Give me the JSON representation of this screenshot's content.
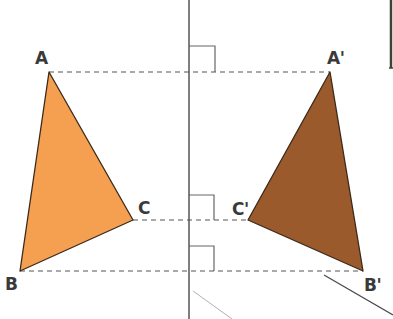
{
  "diagram": {
    "type": "reflection",
    "mirror_line": {
      "x": 189,
      "y1": 0,
      "y2": 319,
      "color": "#555555"
    },
    "colors": {
      "original_fill": "#f5a050",
      "image_fill": "#9b5a2c",
      "outline": "#3a2a1a",
      "dashed": "#555555",
      "right_angle": "#666666",
      "label": "#3a3a3a"
    },
    "original_triangle": {
      "vertices": [
        {
          "label": "A",
          "x": 49,
          "y": 72
        },
        {
          "label": "B",
          "x": 20,
          "y": 271
        },
        {
          "label": "C",
          "x": 133,
          "y": 220
        }
      ]
    },
    "image_triangle": {
      "vertices": [
        {
          "label": "A'",
          "x": 330,
          "y": 72
        },
        {
          "label": "B'",
          "x": 363,
          "y": 271
        },
        {
          "label": "C'",
          "x": 248,
          "y": 220
        }
      ]
    },
    "connector_lines": [
      {
        "from": "A",
        "to": "A'",
        "y": 72
      },
      {
        "from": "C",
        "to": "C'",
        "y": 220
      },
      {
        "from": "B",
        "to": "B'",
        "y": 271
      }
    ],
    "right_angle_markers": [
      {
        "at_y": 72,
        "size": 26
      },
      {
        "at_y": 220,
        "size": 25
      },
      {
        "at_y": 271,
        "size": 25
      }
    ],
    "labels": {
      "A": "A",
      "B": "B",
      "C": "C",
      "A_prime": "A'",
      "B_prime": "B'",
      "C_prime": "C'"
    }
  }
}
